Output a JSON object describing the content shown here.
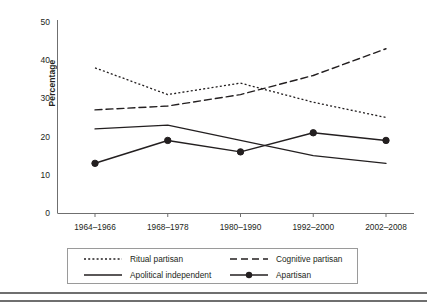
{
  "chart_data": {
    "type": "line",
    "title": "",
    "xlabel": "",
    "ylabel": "Percentage",
    "categories": [
      "1964–1966",
      "1968–1978",
      "1980–1990",
      "1992–2000",
      "2002–2008"
    ],
    "ylim": [
      0,
      50
    ],
    "yticks": [
      0,
      10,
      20,
      30,
      40,
      50
    ],
    "ytick_labels": [
      "0",
      "10",
      "20",
      "30",
      "40",
      "50"
    ],
    "grid": false,
    "legend_position": "below-axes",
    "series": [
      {
        "name": "Ritual partisan",
        "style": "dotted",
        "color": "#231f20",
        "marker": "none",
        "values": [
          38,
          31,
          34,
          29,
          25
        ]
      },
      {
        "name": "Cognitive partisan",
        "style": "dashed",
        "color": "#231f20",
        "marker": "none",
        "values": [
          27,
          28,
          31,
          36,
          43
        ]
      },
      {
        "name": "Apolitical independent",
        "style": "solid",
        "color": "#231f20",
        "marker": "none",
        "values": [
          22,
          23,
          19,
          15,
          13
        ]
      },
      {
        "name": "Apartisan",
        "style": "solid",
        "color": "#231f20",
        "marker": "circle",
        "values": [
          13,
          19,
          16,
          21,
          19
        ]
      }
    ]
  },
  "axis": {
    "y_title": "Percentage"
  }
}
